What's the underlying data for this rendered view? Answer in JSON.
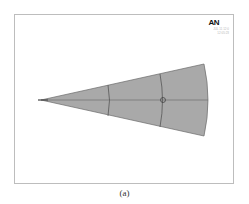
{
  "viewport": {
    "logo": "AN",
    "date_text": "JUL 11 12:0",
    "time_text": "12:05:23"
  },
  "model": {
    "fill_color": "#a9a9a9",
    "edge_color": "#5a5a5a",
    "shape": "wedge-sector",
    "apex": [
      41,
      100
    ],
    "outer_top": [
      204,
      64
    ],
    "outer_bottom": [
      204,
      136
    ],
    "arcs_x": [
      109,
      162
    ],
    "marker_circle": [
      163,
      100
    ]
  },
  "caption": "(a)"
}
